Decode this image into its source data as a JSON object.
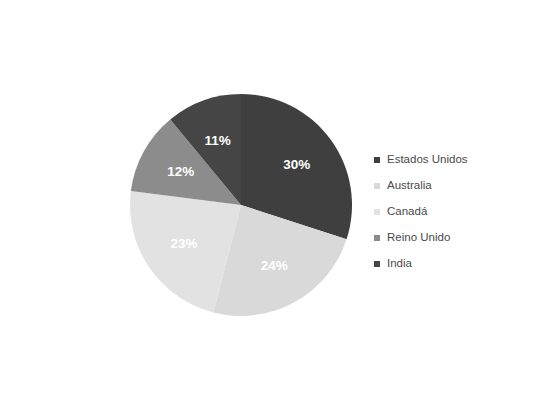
{
  "chart_data": {
    "type": "pie",
    "title": "",
    "legend_position": "right",
    "categories": [
      "Estados Unidos",
      "Australia",
      "Canadá",
      "Reino Unido",
      "India"
    ],
    "values": [
      30,
      24,
      23,
      12,
      11
    ],
    "value_labels": [
      "30%",
      "24%",
      "23%",
      "12%",
      "11%"
    ],
    "colors": [
      "#3f3f3f",
      "#d9d9d9",
      "#e2e2e2",
      "#8c8c8c",
      "#454545"
    ],
    "units": "percent",
    "start_angle_deg": 0,
    "direction": "clockwise",
    "slices": [
      {
        "label": "Estados Unidos",
        "value": 30,
        "display": "30%",
        "color": "#3f3f3f"
      },
      {
        "label": "Australia",
        "value": 24,
        "display": "24%",
        "color": "#d9d9d9"
      },
      {
        "label": "Canadá",
        "value": 23,
        "display": "23%",
        "color": "#e2e2e2"
      },
      {
        "label": "Reino Unido",
        "value": 12,
        "display": "12%",
        "color": "#8c8c8c"
      },
      {
        "label": "India",
        "value": 11,
        "display": "11%",
        "color": "#454545"
      }
    ]
  },
  "legend": {
    "items": [
      {
        "label": "Estados Unidos",
        "color": "#3f3f3f"
      },
      {
        "label": "Australia",
        "color": "#d9d9d9"
      },
      {
        "label": "Canadá",
        "color": "#e2e2e2"
      },
      {
        "label": "Reino Unido",
        "color": "#8c8c8c"
      },
      {
        "label": "India",
        "color": "#454545"
      }
    ]
  }
}
